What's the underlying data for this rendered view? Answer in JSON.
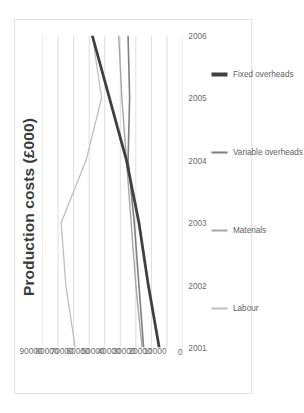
{
  "chart_data": {
    "type": "line",
    "title": "Production costs (£000)",
    "xlabel": "",
    "ylabel": "",
    "ylim": [
      0,
      90000
    ],
    "ytick_labels": [
      "90000",
      "80000",
      "70000",
      "60000",
      "50000",
      "40000",
      "30000",
      "20000",
      "10000",
      "0"
    ],
    "ytick_values": [
      90000,
      80000,
      70000,
      60000,
      50000,
      40000,
      30000,
      20000,
      10000,
      0
    ],
    "categories": [
      "2001",
      "2002",
      "2003",
      "2004",
      "2005",
      "2006"
    ],
    "x": [
      "2001",
      "2002",
      "2003",
      "2004",
      "2005",
      "2006"
    ],
    "grid": true,
    "legend_position": "bottom",
    "rotation_degrees": -90,
    "series": [
      {
        "name": "Labour",
        "color": "#bfbfbf",
        "width": 1.3,
        "values": [
          69000,
          75000,
          78000,
          62000,
          52000,
          58000
        ]
      },
      {
        "name": "Materials",
        "color": "#a6a6a6",
        "width": 1.4,
        "values": [
          26000,
          30000,
          33000,
          36000,
          39000,
          41000
        ]
      },
      {
        "name": "Variable overheads",
        "color": "#7f7f7f",
        "width": 1.6,
        "values": [
          25000,
          28000,
          31000,
          35000,
          34000,
          35000
        ]
      },
      {
        "name": "Fixed overheads",
        "color": "#404040",
        "width": 2.8,
        "values": [
          15000,
          22000,
          28000,
          36000,
          47000,
          58000
        ]
      }
    ]
  },
  "legend": {
    "items": [
      {
        "label": "Labour",
        "color": "#bfbfbf",
        "width": 1.6
      },
      {
        "label": "Materials",
        "color": "#a6a6a6",
        "width": 1.8
      },
      {
        "label": "Variable overheads",
        "color": "#7f7f7f",
        "width": 2.0
      },
      {
        "label": "Fixed overheads",
        "color": "#404040",
        "width": 3.2
      }
    ]
  },
  "style": {
    "background": "#ffffff",
    "border": "#e3e3e3",
    "gridline": "#d9d9d9",
    "text": "#6e6e6e",
    "title_text": "#3b3b3b"
  }
}
